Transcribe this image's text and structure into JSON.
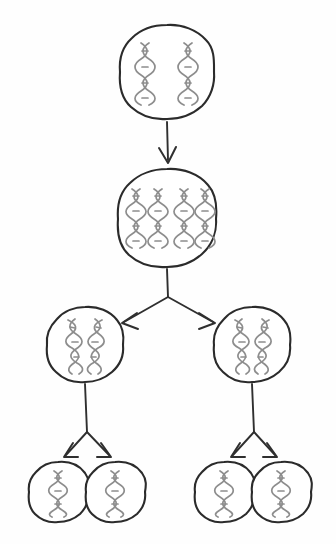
{
  "figure": {
    "background_color": "#ffffff",
    "outline_color": "#2b2b2b",
    "dna_color": "#8d8d8d",
    "arrow_color": "#2f2f2f",
    "has_text_labels": false,
    "caption": ""
  },
  "levels": [
    {
      "name": "parent-cell",
      "row": 1,
      "cell_count": 1,
      "dna_strands_per_cell": 2,
      "dna_arrangement": "two-vertical-helices"
    },
    {
      "name": "replicated-cell",
      "row": 2,
      "cell_count": 1,
      "dna_strands_per_cell": 4,
      "dna_arrangement": "two-pairs-of-vertical-helices"
    },
    {
      "name": "daughter-cells-first-division",
      "row": 3,
      "cell_count": 2,
      "dna_strands_per_cell": 2,
      "dna_arrangement": "crossed-x-shaped-helices"
    },
    {
      "name": "daughter-cells-second-division",
      "row": 4,
      "cell_count": 4,
      "dna_strands_per_cell": 1,
      "dna_arrangement": "single-vertical-helix"
    }
  ],
  "cells": [
    {
      "id": "cell-parent",
      "cx": 167,
      "cy": 72,
      "r": 47,
      "strands": 2,
      "layout": "pair-vertical"
    },
    {
      "id": "cell-replicated",
      "cx": 167,
      "cy": 218,
      "r": 49,
      "strands": 4,
      "layout": "quad-vertical"
    },
    {
      "id": "cell-left-mid",
      "cx": 85,
      "cy": 345,
      "r": 38,
      "strands": 2,
      "layout": "crossed"
    },
    {
      "id": "cell-right-mid",
      "cx": 252,
      "cy": 345,
      "r": 38,
      "strands": 2,
      "layout": "crossed"
    },
    {
      "id": "cell-bottom-1",
      "cx": 58,
      "cy": 492,
      "r": 30,
      "strands": 1,
      "layout": "single-vertical"
    },
    {
      "id": "cell-bottom-2",
      "cx": 115,
      "cy": 492,
      "r": 30,
      "strands": 1,
      "layout": "single-vertical"
    },
    {
      "id": "cell-bottom-3",
      "cx": 224,
      "cy": 492,
      "r": 30,
      "strands": 1,
      "layout": "single-vertical"
    },
    {
      "id": "cell-bottom-4",
      "cx": 281,
      "cy": 492,
      "r": 30,
      "strands": 1,
      "layout": "single-vertical"
    }
  ],
  "arrows": [
    {
      "id": "arrow-replication",
      "type": "straight-down",
      "from": "cell-parent",
      "to": "cell-replicated"
    },
    {
      "id": "arrow-split-first",
      "type": "y-branch",
      "from": "cell-replicated",
      "to": "cell-left-mid, cell-right-mid"
    },
    {
      "id": "arrow-split-left-second",
      "type": "y-branch",
      "from": "cell-left-mid",
      "to": "cell-bottom-1, cell-bottom-2"
    },
    {
      "id": "arrow-split-right-second",
      "type": "y-branch",
      "from": "cell-right-mid",
      "to": "cell-bottom-3, cell-bottom-4"
    }
  ]
}
